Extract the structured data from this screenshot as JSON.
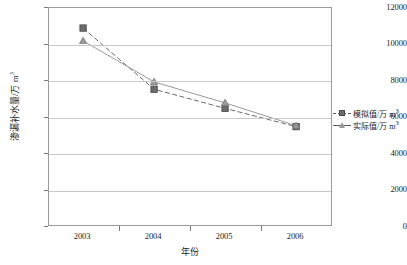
{
  "chart_data": {
    "type": "line",
    "title": "",
    "xlabel": "年份",
    "ylabel": "渗漏补水量/万 m³",
    "categories": [
      "2003",
      "2004",
      "2005",
      "2006"
    ],
    "ylim": [
      0,
      12000
    ],
    "ytick_labels": [
      "0",
      "2000",
      "4000",
      "6000",
      "8000",
      "10000",
      "12000"
    ],
    "ytick_values": [
      0,
      2000,
      4000,
      6000,
      8000,
      10000,
      12000
    ],
    "grid": true,
    "legend_position": "right",
    "series": [
      {
        "name": "模拟值/万 m³",
        "marker": "square",
        "line_style": "dashed",
        "color": "#6b6b6b",
        "values": [
          10900,
          7550,
          6500,
          5500
        ]
      },
      {
        "name": "实际值/万 m³",
        "marker": "triangle",
        "line_style": "solid",
        "color": "#9a9a9a",
        "values": [
          10200,
          7950,
          6800,
          5550
        ]
      }
    ]
  },
  "axes": {
    "y_title_main": "渗漏补水量/万 m",
    "y_title_sup": "3",
    "x_title": "年份"
  },
  "legend": {
    "items": [
      {
        "label_main": "模拟值/万 m",
        "label_sup": "3"
      },
      {
        "label_main": "实际值/万 m",
        "label_sup": "3"
      }
    ]
  },
  "colors": {
    "series_simulated": "#6b6b6b",
    "series_actual": "#9a9a9a",
    "gridline": "#c8c8c8",
    "frame": "#9a9a9a",
    "text": "#1d1d1d"
  }
}
